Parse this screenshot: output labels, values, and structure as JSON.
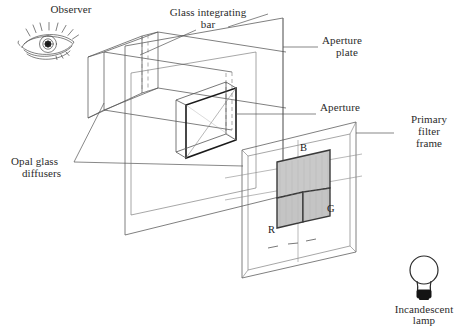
{
  "figure": {
    "kind": "optical-apparatus-diagram",
    "title_visible": false,
    "background_color": "#ffffff",
    "line_color": "#3a3a3a",
    "text_color": "#2b2b2b"
  },
  "labels": {
    "observer": "Observer",
    "glass_integrating_bar_line1": "Glass integrating",
    "glass_integrating_bar_line2": "bar",
    "aperture_plate_line1": "Aperture",
    "aperture_plate_line2": "plate",
    "aperture": "Aperture",
    "primary_filter_frame_line1": "Primary",
    "primary_filter_frame_line2": "filter",
    "primary_filter_frame_line3": "frame",
    "opal_glass_diffusers_line1": "Opal glass",
    "opal_glass_diffusers_line2": "diffusers",
    "incandescent_lamp_line1": "Incandescent",
    "incandescent_lamp_line2": "lamp"
  },
  "filters": {
    "blue_label": "B",
    "red_label": "R",
    "green_label": "G",
    "swatch_fill": "#c9c9c9",
    "swatch_stroke": "#3a3a3a"
  },
  "icons": {
    "observer_eye": "eye-icon",
    "lamp": "incandescent-lamp-icon",
    "bulb_base_color": "#141414"
  }
}
